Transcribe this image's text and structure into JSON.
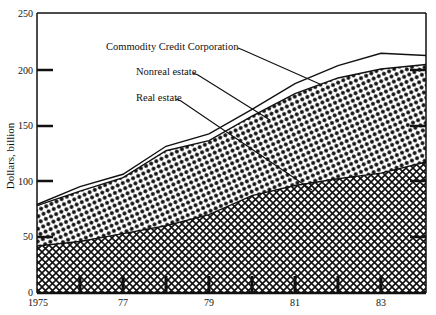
{
  "chart_data": {
    "type": "area",
    "stacked": true,
    "title": "",
    "xlabel": "",
    "ylabel": "Dollars, billion",
    "ylim": [
      0,
      250
    ],
    "xlim": [
      1975,
      1984.3
    ],
    "yticks": [
      0,
      50,
      100,
      150,
      200,
      250
    ],
    "xtick_labels": [
      {
        "x": 1975,
        "label": "1975"
      },
      {
        "x": 1977,
        "label": "77"
      },
      {
        "x": 1979,
        "label": "79"
      },
      {
        "x": 1981,
        "label": "81"
      },
      {
        "x": 1983,
        "label": "83"
      }
    ],
    "grid": false,
    "x": [
      1975,
      1976,
      1977,
      1978,
      1979,
      1980,
      1981,
      1982,
      1983,
      1984.3
    ],
    "series": [
      {
        "name": "Real estate",
        "pattern": "crosshatch",
        "cumulative": [
          42,
          46,
          53,
          60,
          70,
          87,
          96,
          102,
          107,
          117
        ]
      },
      {
        "name": "Nonreal estate",
        "pattern": "dots",
        "cumulative": [
          78,
          91,
          103,
          127,
          136,
          158,
          178,
          192,
          200,
          204
        ]
      },
      {
        "name": "Commodity Credit Corporation",
        "pattern": "none",
        "cumulative": [
          79,
          95,
          106,
          131,
          142,
          164,
          187,
          203,
          214,
          212
        ]
      }
    ],
    "annotations": [
      {
        "text": "Commodity Credit Corporation",
        "points_to": "Commodity Credit Corporation"
      },
      {
        "text": "Nonreal estate",
        "points_to": "Nonreal estate"
      },
      {
        "text": "Real estate",
        "points_to": "Real estate"
      }
    ]
  },
  "labels": {
    "ylabel": "Dollars, billion",
    "ccc": "Commodity Credit Corporation",
    "nonreal": "Nonreal estate",
    "real": "Real estate",
    "y0": "0",
    "y50": "50",
    "y100": "100",
    "y150": "150",
    "y200": "200",
    "y250": "250",
    "x1975": "1975",
    "x77": "77",
    "x79": "79",
    "x81": "81",
    "x83": "83"
  }
}
